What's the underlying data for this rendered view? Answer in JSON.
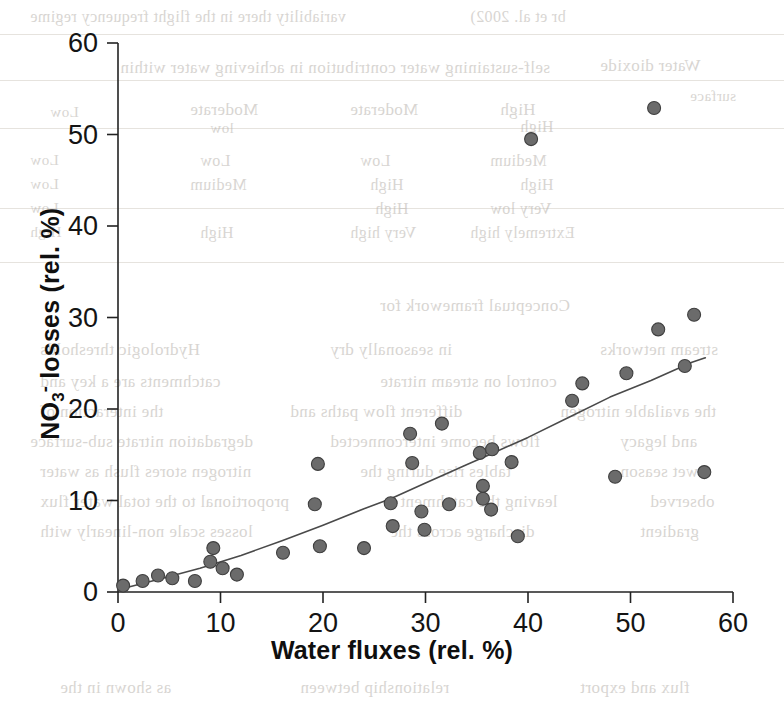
{
  "chart_data": {
    "type": "scatter",
    "title": "",
    "xlabel": "Water fluxes (rel. %)",
    "ylabel_parts": {
      "base": "NO",
      "sub": "3",
      "sup": "-",
      "rest": " losses (rel. %)"
    },
    "ylabel": "NO3- losses (rel. %)",
    "xlim": [
      0,
      60
    ],
    "ylim": [
      0,
      60
    ],
    "xticks": [
      0,
      10,
      20,
      30,
      40,
      50,
      60
    ],
    "yticks": [
      0,
      10,
      20,
      30,
      40,
      50,
      60
    ],
    "grid": false,
    "legend": null,
    "marker": {
      "shape": "circle",
      "size_px": 13,
      "fill": "#6b6b6b",
      "edge": "#3f3f3f"
    },
    "points": [
      {
        "x": 0.5,
        "y": 0.7
      },
      {
        "x": 2.4,
        "y": 1.2
      },
      {
        "x": 3.9,
        "y": 1.8
      },
      {
        "x": 5.3,
        "y": 1.5
      },
      {
        "x": 7.5,
        "y": 1.2
      },
      {
        "x": 9.0,
        "y": 3.3
      },
      {
        "x": 9.3,
        "y": 4.8
      },
      {
        "x": 10.2,
        "y": 2.6
      },
      {
        "x": 11.6,
        "y": 1.9
      },
      {
        "x": 16.1,
        "y": 4.3
      },
      {
        "x": 19.2,
        "y": 9.6
      },
      {
        "x": 19.5,
        "y": 14.0
      },
      {
        "x": 19.7,
        "y": 5.0
      },
      {
        "x": 24.0,
        "y": 4.8
      },
      {
        "x": 26.6,
        "y": 9.7
      },
      {
        "x": 26.8,
        "y": 7.2
      },
      {
        "x": 28.5,
        "y": 17.3
      },
      {
        "x": 28.7,
        "y": 14.1
      },
      {
        "x": 29.6,
        "y": 8.8
      },
      {
        "x": 29.9,
        "y": 6.8
      },
      {
        "x": 31.6,
        "y": 18.4
      },
      {
        "x": 32.3,
        "y": 9.6
      },
      {
        "x": 35.3,
        "y": 15.2
      },
      {
        "x": 35.6,
        "y": 10.2
      },
      {
        "x": 35.6,
        "y": 11.6
      },
      {
        "x": 36.5,
        "y": 15.6
      },
      {
        "x": 36.4,
        "y": 9.0
      },
      {
        "x": 38.4,
        "y": 14.2
      },
      {
        "x": 39.0,
        "y": 6.1
      },
      {
        "x": 40.3,
        "y": 49.5
      },
      {
        "x": 44.3,
        "y": 20.9
      },
      {
        "x": 45.3,
        "y": 22.8
      },
      {
        "x": 48.5,
        "y": 12.6
      },
      {
        "x": 49.6,
        "y": 23.9
      },
      {
        "x": 52.3,
        "y": 52.9
      },
      {
        "x": 52.7,
        "y": 28.7
      },
      {
        "x": 55.3,
        "y": 24.7
      },
      {
        "x": 56.2,
        "y": 30.3
      },
      {
        "x": 57.2,
        "y": 13.1
      }
    ],
    "trend_line": {
      "style": "solid",
      "color": "#4a4a4a",
      "width_px": 1.6,
      "note": "fitted curve, slightly concave-up",
      "points": [
        {
          "x": 0.2,
          "y": 0.3
        },
        {
          "x": 4.0,
          "y": 1.4
        },
        {
          "x": 8.0,
          "y": 2.6
        },
        {
          "x": 12.0,
          "y": 4.0
        },
        {
          "x": 16.0,
          "y": 5.6
        },
        {
          "x": 20.0,
          "y": 7.3
        },
        {
          "x": 24.0,
          "y": 9.1
        },
        {
          "x": 26.6,
          "y": 10.2
        },
        {
          "x": 30.0,
          "y": 11.9
        },
        {
          "x": 34.0,
          "y": 13.9
        },
        {
          "x": 36.0,
          "y": 14.9
        },
        {
          "x": 40.0,
          "y": 16.9
        },
        {
          "x": 44.0,
          "y": 19.1
        },
        {
          "x": 48.0,
          "y": 21.3
        },
        {
          "x": 52.0,
          "y": 23.1
        },
        {
          "x": 56.0,
          "y": 25.1
        },
        {
          "x": 57.3,
          "y": 25.6
        }
      ]
    }
  },
  "background_bleed": {
    "note": "faint mirrored show-through text from the reverse side of the scanned page",
    "lines": [
      {
        "text": "variability there in the flight frequency regime",
        "x": 30,
        "y": 8,
        "size": 16
      },
      {
        "text": "br et al. 2002)",
        "x": 470,
        "y": 8,
        "size": 16
      },
      {
        "text": "Water dioxide",
        "x": 600,
        "y": 56,
        "size": 17
      },
      {
        "text": "self-sustaining water contribution in achieving water within",
        "x": 120,
        "y": 58,
        "size": 17
      },
      {
        "text": "surface",
        "x": 690,
        "y": 88,
        "size": 15
      },
      {
        "text": "High",
        "x": 500,
        "y": 100,
        "size": 17
      },
      {
        "text": "Moderate",
        "x": 350,
        "y": 100,
        "size": 17
      },
      {
        "text": "Moderate",
        "x": 190,
        "y": 100,
        "size": 17
      },
      {
        "text": "Low",
        "x": 50,
        "y": 104,
        "size": 15
      },
      {
        "text": "High",
        "x": 520,
        "y": 118,
        "size": 16
      },
      {
        "text": "low",
        "x": 210,
        "y": 120,
        "size": 15
      },
      {
        "text": "Medium",
        "x": 490,
        "y": 152,
        "size": 16
      },
      {
        "text": "Low",
        "x": 360,
        "y": 152,
        "size": 16
      },
      {
        "text": "Low",
        "x": 200,
        "y": 152,
        "size": 16
      },
      {
        "text": "Low",
        "x": 30,
        "y": 152,
        "size": 15
      },
      {
        "text": "High",
        "x": 520,
        "y": 176,
        "size": 16
      },
      {
        "text": "High",
        "x": 370,
        "y": 176,
        "size": 16
      },
      {
        "text": "Medium",
        "x": 190,
        "y": 176,
        "size": 16
      },
      {
        "text": "Low",
        "x": 30,
        "y": 176,
        "size": 15
      },
      {
        "text": "Very low",
        "x": 490,
        "y": 200,
        "size": 16
      },
      {
        "text": "High",
        "x": 375,
        "y": 200,
        "size": 16
      },
      {
        "text": "Low",
        "x": 30,
        "y": 200,
        "size": 15
      },
      {
        "text": "Extremely high",
        "x": 470,
        "y": 224,
        "size": 16
      },
      {
        "text": "Very high",
        "x": 350,
        "y": 224,
        "size": 16
      },
      {
        "text": "High",
        "x": 200,
        "y": 224,
        "size": 16
      },
      {
        "text": "High",
        "x": 30,
        "y": 224,
        "size": 15
      },
      {
        "text": "Conceptual framework for",
        "x": 380,
        "y": 296,
        "size": 17
      },
      {
        "text": "Hydrologic thresholds",
        "x": 40,
        "y": 340,
        "size": 17
      },
      {
        "text": "in seasonally dry",
        "x": 330,
        "y": 340,
        "size": 17
      },
      {
        "text": "stream networks",
        "x": 600,
        "y": 340,
        "size": 17
      },
      {
        "text": "catchments are a key and",
        "x": 40,
        "y": 372,
        "size": 17
      },
      {
        "text": "control on stream nitrate",
        "x": 380,
        "y": 372,
        "size": 17
      },
      {
        "text": "the interaction of",
        "x": 40,
        "y": 402,
        "size": 17
      },
      {
        "text": "different flow paths and",
        "x": 290,
        "y": 402,
        "size": 17
      },
      {
        "text": "the available nitrogen",
        "x": 560,
        "y": 402,
        "size": 17
      },
      {
        "text": "degradation nitrate sub-surface",
        "x": 30,
        "y": 432,
        "size": 17
      },
      {
        "text": "flows become interconnected",
        "x": 330,
        "y": 432,
        "size": 17
      },
      {
        "text": "and legacy",
        "x": 620,
        "y": 432,
        "size": 17
      },
      {
        "text": "nitrogen stores flush as water",
        "x": 40,
        "y": 462,
        "size": 17
      },
      {
        "text": "tables rise during the",
        "x": 360,
        "y": 462,
        "size": 17
      },
      {
        "text": "wet season",
        "x": 620,
        "y": 462,
        "size": 17
      },
      {
        "text": "proportional to the total water flux",
        "x": 40,
        "y": 492,
        "size": 17
      },
      {
        "text": "leaving the catchment",
        "x": 400,
        "y": 492,
        "size": 17
      },
      {
        "text": "observed",
        "x": 650,
        "y": 492,
        "size": 17
      },
      {
        "text": "losses scale non-linearly with",
        "x": 40,
        "y": 522,
        "size": 17
      },
      {
        "text": "discharge across the",
        "x": 390,
        "y": 522,
        "size": 17
      },
      {
        "text": "gradient",
        "x": 640,
        "y": 522,
        "size": 17
      },
      {
        "text": "as shown in the",
        "x": 60,
        "y": 678,
        "size": 17
      },
      {
        "text": "relationship between",
        "x": 300,
        "y": 678,
        "size": 17
      },
      {
        "text": "flux and export",
        "x": 580,
        "y": 678,
        "size": 17
      }
    ],
    "rules": [
      {
        "x": 0,
        "y": 34,
        "w": 784
      },
      {
        "x": 0,
        "y": 80,
        "w": 784
      },
      {
        "x": 0,
        "y": 128,
        "w": 784
      },
      {
        "x": 0,
        "y": 208,
        "w": 784
      },
      {
        "x": 0,
        "y": 262,
        "w": 784
      }
    ]
  }
}
